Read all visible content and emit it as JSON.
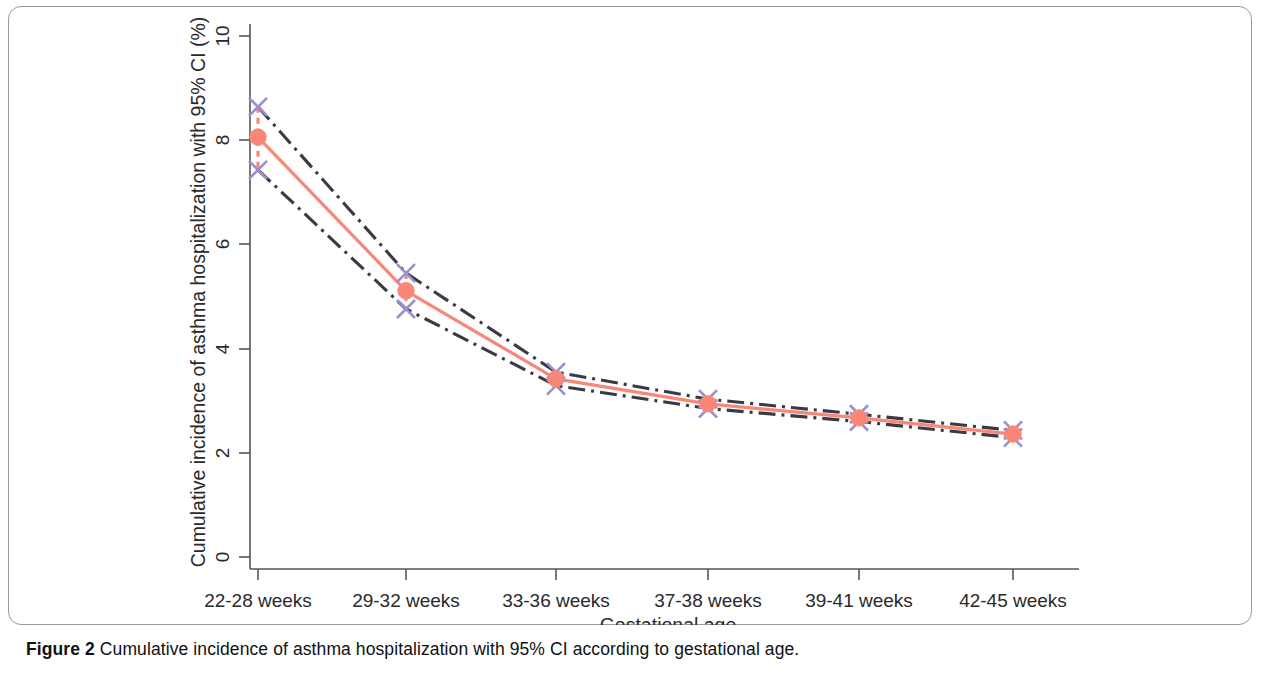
{
  "figure": {
    "caption_label": "Figure 2",
    "caption_text": "Cumulative incidence of asthma hospitalization with 95% CI according to gestational age."
  },
  "chart_data": {
    "type": "line",
    "title": "",
    "subtitle": "",
    "xlabel": "Gestational age",
    "ylabel": "Cumulative incidence of asthma hospitalization with 95% CI (%)",
    "categories": [
      "22-28 weeks",
      "29-32 weeks",
      "33-36 weeks",
      "37-38 weeks",
      "39-41 weeks",
      "42-45 weeks"
    ],
    "xtick_labels": [
      "22-28 weeks",
      "29-32 weeks",
      "33-36 weeks",
      "37-38 weeks",
      "39-41 weeks",
      "42-45 weeks"
    ],
    "ytick_labels": [
      "0",
      "2",
      "4",
      "6",
      "8",
      "10"
    ],
    "yticks": [
      0,
      2,
      4,
      6,
      8,
      10
    ],
    "ylim": [
      0,
      10
    ],
    "grid": false,
    "legend": "none",
    "series": [
      {
        "name": "Cumulative incidence",
        "style": "solid-line-with-circle-markers",
        "color": "#f98777",
        "values": [
          8.06,
          5.11,
          3.42,
          2.94,
          2.67,
          2.36
        ]
      },
      {
        "name": "Upper 95% CI",
        "style": "dash-dot-line-with-x-markers",
        "color": "#3a3a46",
        "marker_color": "#9a8fd0",
        "values": [
          8.64,
          5.45,
          3.55,
          3.03,
          2.74,
          2.43
        ]
      },
      {
        "name": "Lower 95% CI",
        "style": "dash-dot-line-with-x-markers",
        "color": "#3a3a46",
        "marker_color": "#9a8fd0",
        "values": [
          7.43,
          4.76,
          3.29,
          2.85,
          2.6,
          2.29
        ]
      }
    ],
    "error_bar_color": "#f98777",
    "error_bar_style": "dashed-vertical"
  }
}
